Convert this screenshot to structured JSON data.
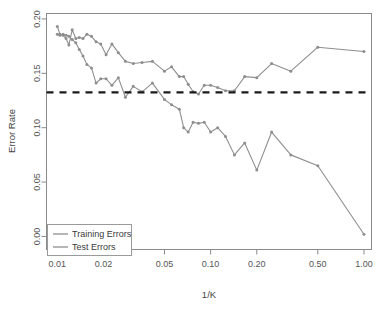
{
  "chart_data": {
    "type": "line",
    "title": "",
    "subtitle": "",
    "xlabel": "1/K",
    "ylabel": "Error Rate",
    "xscale": "log",
    "yscale": "linear",
    "xlim": [
      0.0085,
      1.12
    ],
    "ylim": [
      -0.012,
      0.205
    ],
    "grid": false,
    "legend_position": "bottom-left",
    "xticks": [
      0.01,
      0.02,
      0.05,
      0.1,
      0.2,
      0.5,
      1.0
    ],
    "xticklabels": [
      "0.01",
      "0.02",
      "0.05",
      "0.10",
      "0.20",
      "0.50",
      "1.00"
    ],
    "yticks": [
      0.0,
      0.05,
      0.1,
      0.15,
      0.2
    ],
    "yticklabels": [
      "0.00",
      "0.05",
      "0.10",
      "0.15",
      "0.20"
    ],
    "annotations": [
      {
        "name": "bayes-error-line",
        "kind": "horizontal-dashed-line",
        "y": 0.1325,
        "color": "#1a1a1a",
        "label": ""
      }
    ],
    "series": [
      {
        "name": "Training Errors",
        "color": "#8e8e8e",
        "marker": "dot",
        "linestyle": "solid",
        "x": [
          0.01,
          0.0104,
          0.0109,
          0.0114,
          0.0119,
          0.0125,
          0.0132,
          0.0139,
          0.0147,
          0.0156,
          0.0167,
          0.0179,
          0.0192,
          0.0208,
          0.0227,
          0.025,
          0.0278,
          0.0313,
          0.0357,
          0.0417,
          0.05,
          0.0556,
          0.0625,
          0.0667,
          0.0714,
          0.0769,
          0.0833,
          0.0909,
          0.1,
          0.1111,
          0.125,
          0.1429,
          0.1667,
          0.2,
          0.25,
          0.3333,
          0.5,
          1.0
        ],
        "y": [
          0.186,
          0.185,
          0.186,
          0.185,
          0.184,
          0.181,
          0.178,
          0.172,
          0.166,
          0.158,
          0.155,
          0.141,
          0.145,
          0.145,
          0.139,
          0.146,
          0.128,
          0.138,
          0.133,
          0.141,
          0.126,
          0.121,
          0.117,
          0.1,
          0.096,
          0.105,
          0.104,
          0.105,
          0.096,
          0.1,
          0.092,
          0.075,
          0.086,
          0.061,
          0.096,
          0.075,
          0.065,
          0.002
        ]
      },
      {
        "name": "Test Errors",
        "color": "#8e8e8e",
        "marker": "dot",
        "linestyle": "solid",
        "x": [
          0.01,
          0.0104,
          0.0109,
          0.0114,
          0.0119,
          0.0125,
          0.0132,
          0.0139,
          0.0147,
          0.0156,
          0.0167,
          0.0179,
          0.0192,
          0.0208,
          0.0227,
          0.025,
          0.0278,
          0.0313,
          0.0357,
          0.0417,
          0.05,
          0.0556,
          0.0625,
          0.0667,
          0.0714,
          0.0769,
          0.0833,
          0.0909,
          0.1,
          0.1111,
          0.125,
          0.1429,
          0.1667,
          0.2,
          0.25,
          0.3333,
          0.5,
          1.0
        ],
        "y": [
          0.193,
          0.186,
          0.185,
          0.182,
          0.176,
          0.19,
          0.182,
          0.183,
          0.182,
          0.186,
          0.184,
          0.179,
          0.177,
          0.167,
          0.177,
          0.169,
          0.161,
          0.159,
          0.16,
          0.161,
          0.152,
          0.156,
          0.147,
          0.147,
          0.14,
          0.133,
          0.131,
          0.139,
          0.139,
          0.137,
          0.134,
          0.134,
          0.147,
          0.146,
          0.159,
          0.152,
          0.174,
          0.17
        ]
      }
    ]
  },
  "legend": {
    "items": [
      {
        "label": "Training Errors"
      },
      {
        "label": "Test Errors"
      }
    ]
  }
}
